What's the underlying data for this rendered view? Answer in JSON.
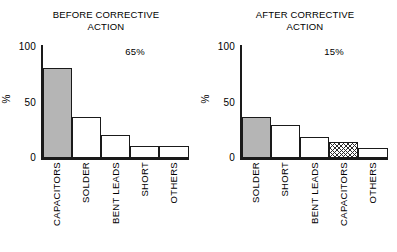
{
  "figure": {
    "background": "#ffffff",
    "ink_color": "#1a1a1a",
    "bar_gray": "#b5b5b5"
  },
  "chart_data": [
    {
      "type": "bar",
      "id": "before-corrective-action",
      "title": "BEFORE CORRECTIVE",
      "title_line2": "ACTION",
      "annotation": "65%",
      "categories": [
        "CAPACITORS",
        "SOLDER",
        "BENT LEADS",
        "SHORT",
        "OTHERS"
      ],
      "values": [
        81,
        37,
        21,
        11,
        11
      ],
      "fills": [
        "gray",
        "white",
        "white",
        "white",
        "white"
      ],
      "xlabel": "",
      "ylabel": "%",
      "ylim": [
        0,
        100
      ],
      "yticks": [
        0,
        50,
        100
      ],
      "ytick_labels": [
        "0",
        "50",
        "100"
      ],
      "grid": false,
      "legend": "none"
    },
    {
      "type": "bar",
      "id": "after-corrective-action",
      "title": "AFTER CORRECTIVE",
      "title_line2": "ACTION",
      "annotation": "15%",
      "categories": [
        "SOLDER",
        "SHORT",
        "BENT LEADS",
        "CAPACITORS",
        "OTHERS"
      ],
      "values": [
        37,
        30,
        19,
        14,
        9
      ],
      "fills": [
        "gray",
        "white",
        "white",
        "hatch",
        "white"
      ],
      "xlabel": "",
      "ylabel": "%",
      "ylim": [
        0,
        100
      ],
      "yticks": [
        0,
        50,
        100
      ],
      "ytick_labels": [
        "0",
        "50",
        "100"
      ],
      "grid": false,
      "legend": "none"
    }
  ]
}
